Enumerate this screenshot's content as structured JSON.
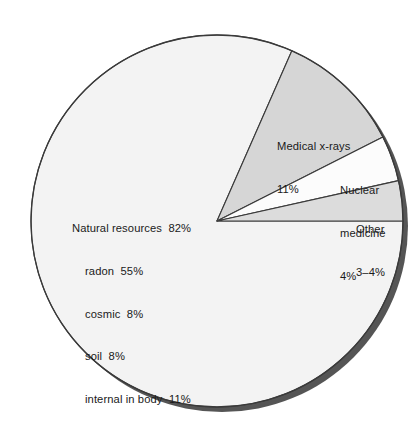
{
  "chart_data": {
    "type": "pie",
    "title": "",
    "subtitle": "",
    "xlabel": "",
    "ylabel": "",
    "legend_position": "inside-slices",
    "grid": false,
    "units": "percent",
    "total": 100,
    "slices": [
      {
        "name": "Natural resources",
        "value": 82,
        "value_label": "82%",
        "color": "#f3f3f3",
        "breakdown": [
          {
            "name": "radon",
            "value": 55,
            "value_label": "55%"
          },
          {
            "name": "cosmic",
            "value": 8,
            "value_label": "8%"
          },
          {
            "name": "soil",
            "value": 8,
            "value_label": "8%"
          },
          {
            "name": "internal in body",
            "value": 11,
            "value_label": "11%"
          }
        ]
      },
      {
        "name": "Medical x-rays",
        "value": 11,
        "value_label": "11%",
        "color": "#d6d6d6",
        "breakdown": []
      },
      {
        "name": "Nuclear medicine",
        "value": 4,
        "value_label": "4%",
        "color": "#fcfcfc",
        "breakdown": []
      },
      {
        "name": "Other",
        "value": 3.5,
        "value_label": "3–4%",
        "color": "#dcdcdc",
        "breakdown": []
      }
    ]
  },
  "labels": {
    "natural": {
      "line1": "Natural resources  82%",
      "line2": "radon  55%",
      "line3": "cosmic  8%",
      "line4": "soil  8%",
      "line5": "internal in body  11%"
    },
    "xray": {
      "line1": "Medical x-rays",
      "line2": "11%"
    },
    "nuclear": {
      "line1": "Nuclear",
      "line2": "medicine",
      "line3": "4%"
    },
    "other": {
      "line1": "Other",
      "line2": "3–4%"
    }
  },
  "colors": {
    "outline": "#3a3a3a",
    "shadow": "#555555",
    "natural_fill": "#f3f3f3",
    "xray_fill": "#d6d6d6",
    "nuclear_fill": "#fcfcfc",
    "other_fill": "#dcdcdc",
    "text": "#1a1a1a",
    "background": "#ffffff"
  }
}
